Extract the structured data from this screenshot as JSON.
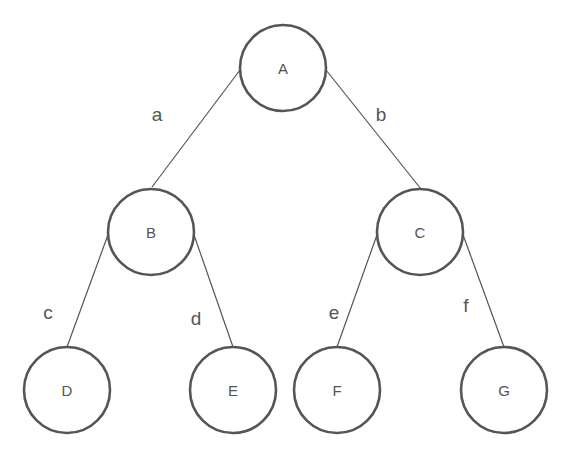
{
  "diagram": {
    "type": "binary-tree",
    "nodes": [
      {
        "id": "A",
        "label": "A"
      },
      {
        "id": "B",
        "label": "B"
      },
      {
        "id": "C",
        "label": "C"
      },
      {
        "id": "D",
        "label": "D"
      },
      {
        "id": "E",
        "label": "E"
      },
      {
        "id": "F",
        "label": "F"
      },
      {
        "id": "G",
        "label": "G"
      }
    ],
    "edges": [
      {
        "from": "A",
        "to": "B",
        "label": "a"
      },
      {
        "from": "A",
        "to": "C",
        "label": "b"
      },
      {
        "from": "B",
        "to": "D",
        "label": "c"
      },
      {
        "from": "B",
        "to": "E",
        "label": "d"
      },
      {
        "from": "C",
        "to": "F",
        "label": "e"
      },
      {
        "from": "C",
        "to": "G",
        "label": "f"
      }
    ],
    "colors": {
      "stroke": "#555555",
      "background": "#ffffff"
    }
  }
}
